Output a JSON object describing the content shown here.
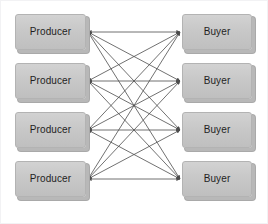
{
  "diagram": {
    "type": "bipartite-graph",
    "frame": {
      "border_color": "#f2f2f4",
      "background": "#ffffff"
    },
    "node_style": {
      "fill": "#c8c8c8",
      "border_color": "#b3b3b3",
      "shadow_color": "#b8b8b8",
      "text_color": "#1f1f1f"
    },
    "edge_style": {
      "color": "#4d4d4d",
      "width": 0.8,
      "arrowheads": "both"
    },
    "left_column": {
      "label": "Producer",
      "count": 4,
      "nodes": [
        {
          "label": "Producer",
          "x": 14,
          "y": 13,
          "w": 71,
          "h": 36
        },
        {
          "label": "Producer",
          "x": 14,
          "y": 62,
          "w": 71,
          "h": 36
        },
        {
          "label": "Producer",
          "x": 14,
          "y": 111,
          "w": 71,
          "h": 36
        },
        {
          "label": "Producer",
          "x": 14,
          "y": 160,
          "w": 71,
          "h": 36
        }
      ]
    },
    "right_column": {
      "label": "Buyer",
      "count": 4,
      "nodes": [
        {
          "label": "Buyer",
          "x": 181,
          "y": 13,
          "w": 70,
          "h": 36
        },
        {
          "label": "Buyer",
          "x": 181,
          "y": 62,
          "w": 70,
          "h": 36
        },
        {
          "label": "Buyer",
          "x": 181,
          "y": 111,
          "w": 70,
          "h": 36
        },
        {
          "label": "Buyer",
          "x": 181,
          "y": 160,
          "w": 70,
          "h": 36
        }
      ]
    },
    "edges": [
      {
        "from": 0,
        "to": 0
      },
      {
        "from": 0,
        "to": 1
      },
      {
        "from": 0,
        "to": 2
      },
      {
        "from": 0,
        "to": 3
      },
      {
        "from": 1,
        "to": 0
      },
      {
        "from": 1,
        "to": 1
      },
      {
        "from": 1,
        "to": 2
      },
      {
        "from": 1,
        "to": 3
      },
      {
        "from": 2,
        "to": 0
      },
      {
        "from": 2,
        "to": 1
      },
      {
        "from": 2,
        "to": 2
      },
      {
        "from": 2,
        "to": 3
      },
      {
        "from": 3,
        "to": 0
      },
      {
        "from": 3,
        "to": 1
      },
      {
        "from": 3,
        "to": 2
      },
      {
        "from": 3,
        "to": 3
      }
    ],
    "edge_count": 16
  }
}
